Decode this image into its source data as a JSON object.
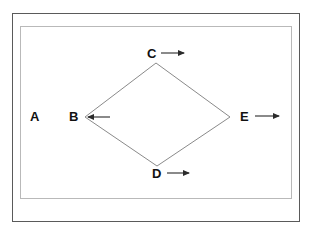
{
  "figure": {
    "type": "geometry-diagram",
    "background_color": "#ffffff",
    "frames": [
      {
        "name": "outer-frame",
        "stroke_color": "#5a5a5a",
        "x": 12,
        "y": 13,
        "width": 288,
        "height": 209
      },
      {
        "name": "inner-frame",
        "stroke_color": "#b9b9b9",
        "x": 20,
        "y": 26,
        "width": 272,
        "height": 173
      }
    ],
    "shape": {
      "name": "rhombus",
      "stroke_color": "#8a8a8a",
      "fill": "none",
      "vertices": [
        {
          "label": "C",
          "x": 156,
          "y": 63
        },
        {
          "label": "E",
          "x": 230,
          "y": 117
        },
        {
          "label": "D",
          "x": 157,
          "y": 166
        },
        {
          "label": "B",
          "x": 85,
          "y": 117
        }
      ]
    },
    "labels": [
      {
        "id": "label-a",
        "text": "A",
        "x": 30,
        "y": 110,
        "has_arrow": false,
        "arrow_direction": "none"
      },
      {
        "id": "label-b",
        "text": "B",
        "x": 69,
        "y": 110,
        "has_arrow": true,
        "arrow_direction": "left",
        "arrow_from_x": 110,
        "arrow_to_x": 88,
        "arrow_y": 117
      },
      {
        "id": "label-c",
        "text": "C",
        "x": 147,
        "y": 47,
        "has_arrow": true,
        "arrow_direction": "right",
        "arrow_from_x": 161,
        "arrow_to_x": 184,
        "arrow_y": 53
      },
      {
        "id": "label-d",
        "text": "D",
        "x": 152,
        "y": 167,
        "has_arrow": true,
        "arrow_direction": "right",
        "arrow_from_x": 167,
        "arrow_to_x": 189,
        "arrow_y": 173
      },
      {
        "id": "label-e",
        "text": "E",
        "x": 240,
        "y": 110,
        "has_arrow": true,
        "arrow_direction": "right",
        "arrow_from_x": 255,
        "arrow_to_x": 279,
        "arrow_y": 116
      }
    ],
    "arrow_color": "#2b2b2b"
  }
}
